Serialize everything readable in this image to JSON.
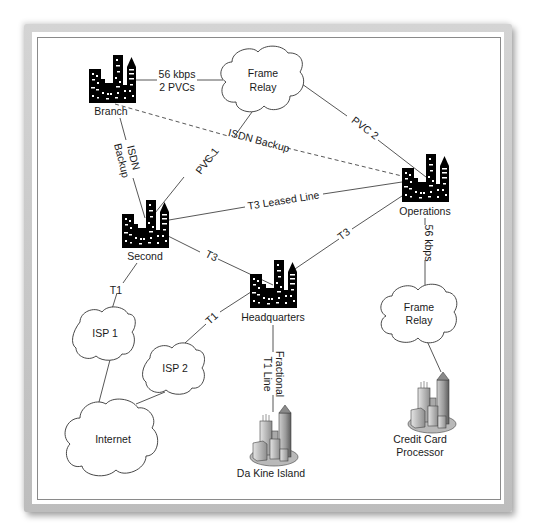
{
  "diagram": {
    "type": "network-topology",
    "nodes": {
      "branch": {
        "label": "Branch",
        "kind": "city-building"
      },
      "frame_relay_top": {
        "line1": "Frame",
        "line2": "Relay",
        "kind": "cloud"
      },
      "second": {
        "label": "Second",
        "kind": "city-building"
      },
      "operations": {
        "label": "Operations",
        "kind": "city-building"
      },
      "headquarters": {
        "label": "Headquarters",
        "kind": "city-building"
      },
      "isp1": {
        "label": "ISP 1",
        "kind": "cloud"
      },
      "isp2": {
        "label": "ISP 2",
        "kind": "cloud"
      },
      "internet": {
        "label": "Internet",
        "kind": "cloud"
      },
      "frame_relay_bottom": {
        "line1": "Frame",
        "line2": "Relay",
        "kind": "cloud"
      },
      "da_kine_island": {
        "label": "Da Kine Island",
        "kind": "3d-city"
      },
      "credit_card_processor": {
        "line1": "Credit Card",
        "line2": "Processor",
        "kind": "3d-city"
      }
    },
    "links": {
      "branch_frame": {
        "line1": "56 kbps",
        "line2": "2 PVCs",
        "style": "solid"
      },
      "branch_operations": {
        "label": "ISDN Backup",
        "style": "dashed"
      },
      "branch_second": {
        "line1": "ISDN",
        "line2": "Backup",
        "style": "solid"
      },
      "frame_second": {
        "label": "PVC 1",
        "style": "solid"
      },
      "frame_operations": {
        "label": "PVC 2",
        "style": "solid"
      },
      "second_operations": {
        "label": "T3 Leased Line",
        "style": "solid"
      },
      "second_hq": {
        "label": "T3",
        "style": "solid"
      },
      "hq_operations": {
        "label": "T3",
        "style": "solid"
      },
      "operations_frame2": {
        "label": "56 kbps",
        "style": "solid"
      },
      "second_isp1": {
        "label": "T1",
        "style": "solid"
      },
      "hq_isp2": {
        "label": "T1",
        "style": "solid"
      },
      "hq_dakine": {
        "line1": "Fractional",
        "line2": "T1 Line",
        "style": "solid"
      },
      "isp1_internet": {
        "label": "",
        "style": "solid"
      },
      "isp2_internet": {
        "label": "",
        "style": "solid"
      },
      "frame2_ccp": {
        "label": "",
        "style": "solid"
      }
    }
  }
}
